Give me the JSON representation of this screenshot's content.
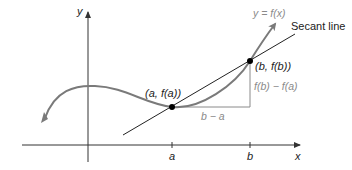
{
  "diagram": {
    "axes": {
      "x_label": "x",
      "y_label": "y"
    },
    "curve_label": "y = f(x)",
    "secant_label": "Secant line",
    "point_a_label": "(a, f(a))",
    "point_b_label": "(b, f(b))",
    "rise_label": "f(b) − f(a)",
    "run_label": "b − a",
    "tick_a": "a",
    "tick_b": "b",
    "colors": {
      "curve": "#7a7a7a",
      "secant": "#222222",
      "axes": "#333333",
      "grey_text": "#8a8a8a",
      "points": "#000000"
    }
  }
}
